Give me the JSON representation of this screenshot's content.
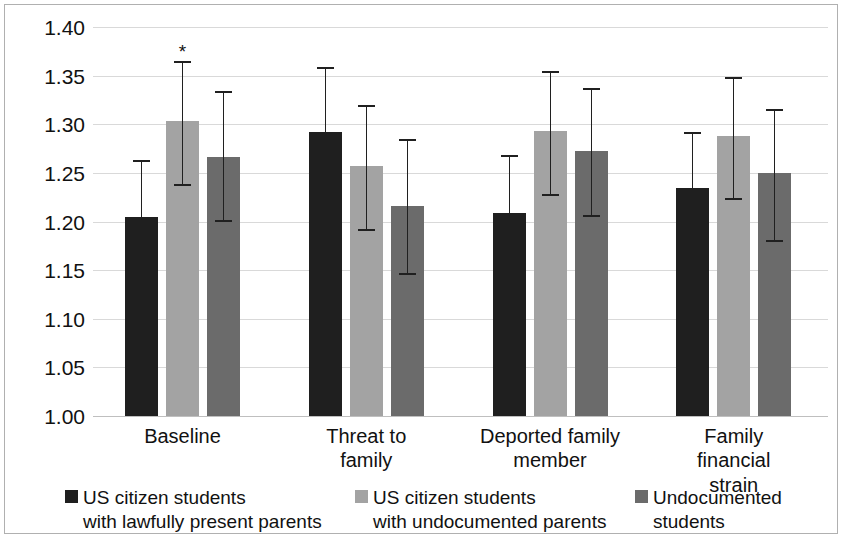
{
  "chart_data": {
    "type": "bar",
    "title": "",
    "subtitle": "",
    "xlabel": "",
    "ylabel": "",
    "grid": true,
    "legend_position": "bottom",
    "ylim": [
      1.0,
      1.4
    ],
    "ytick_labels": [
      "1.40",
      "1.35",
      "1.30",
      "1.25",
      "1.20",
      "1.15",
      "1.10",
      "1.05",
      "1.00"
    ],
    "ytick_values": [
      1.4,
      1.35,
      1.3,
      1.25,
      1.2,
      1.15,
      1.1,
      1.05,
      1.0
    ],
    "categories": [
      "Baseline",
      "Threat to family",
      "Deported family member",
      "Family financial strain"
    ],
    "category_lines": [
      [
        "Baseline"
      ],
      [
        "Threat to",
        "family"
      ],
      [
        "Deported family",
        "member"
      ],
      [
        "Family financial",
        "strain"
      ]
    ],
    "error_bar_type": "confidence-interval",
    "series": [
      {
        "name": "US citizen students with lawfully present parents",
        "color": "#1f1f1f",
        "values": [
          1.205,
          1.292,
          1.209,
          1.234
        ],
        "ci_low": [
          1.205,
          1.292,
          1.209,
          1.234
        ],
        "ci_high": [
          1.263,
          1.359,
          1.268,
          1.292
        ]
      },
      {
        "name": "US citizen students with undocumented parents",
        "color": "#a3a3a3",
        "values": [
          1.303,
          1.257,
          1.293,
          1.288
        ],
        "ci_low": [
          1.239,
          1.192,
          1.228,
          1.224
        ],
        "ci_high": [
          1.365,
          1.32,
          1.355,
          1.349
        ]
      },
      {
        "name": "Undocumented students",
        "color": "#6b6b6b",
        "values": [
          1.266,
          1.216,
          1.273,
          1.25
        ],
        "ci_low": [
          1.202,
          1.147,
          1.207,
          1.181
        ],
        "ci_high": [
          1.334,
          1.285,
          1.337,
          1.316
        ]
      }
    ],
    "annotations": [
      {
        "text": "*",
        "category": "Baseline",
        "series": "US citizen students with undocumented parents",
        "value": 1.385
      }
    ]
  },
  "legend": {
    "items": [
      {
        "label": "US citizen students\nwith lawfully present parents",
        "color": "#1f1f1f"
      },
      {
        "label": "US citizen students\nwith undocumented parents",
        "color": "#a3a3a3"
      },
      {
        "label": "Undocumented\nstudents",
        "color": "#6b6b6b"
      }
    ]
  }
}
